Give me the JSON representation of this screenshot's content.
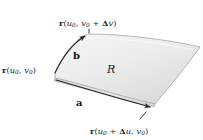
{
  "figure": {
    "kind": "surface-patch-diagram",
    "width": 203,
    "height": 140,
    "background_color": "#ffffff",
    "labels": {
      "corner_top": {
        "vector": "r",
        "open_paren": "(",
        "u": "u",
        "u_sub": "0",
        "comma": ", ",
        "v": "v",
        "v_sub": "0",
        "plus": " + ",
        "delta": "Δ",
        "delta_var": "v",
        "close_paren": ")",
        "plain": "r (u0, v0 + Δv)"
      },
      "corner_left": {
        "vector": "r",
        "open_paren": "(",
        "u": "u",
        "u_sub": "0",
        "comma": ", ",
        "v": "v",
        "v_sub": "0",
        "close_paren": ")",
        "plain": "r (u0, v0)"
      },
      "corner_bottom": {
        "vector": "r",
        "open_paren": "(",
        "u": "u",
        "u_sub": "0",
        "plus": " + ",
        "delta": "Δ",
        "delta_var": "u",
        "comma": ", ",
        "v": "v",
        "v_sub": "0",
        "close_paren": ")",
        "plain": "r (u0 + Δu, v0)"
      },
      "vector_a": "a",
      "vector_b": "b",
      "region": "R"
    },
    "colors": {
      "patch_light": "#f1f1f0",
      "patch_mid": "#e3e3e1",
      "patch_dark": "#cfcfcd",
      "outline": "#9a9a98",
      "arrow": "#2a2a2a",
      "text": "#1b1b1b"
    }
  }
}
